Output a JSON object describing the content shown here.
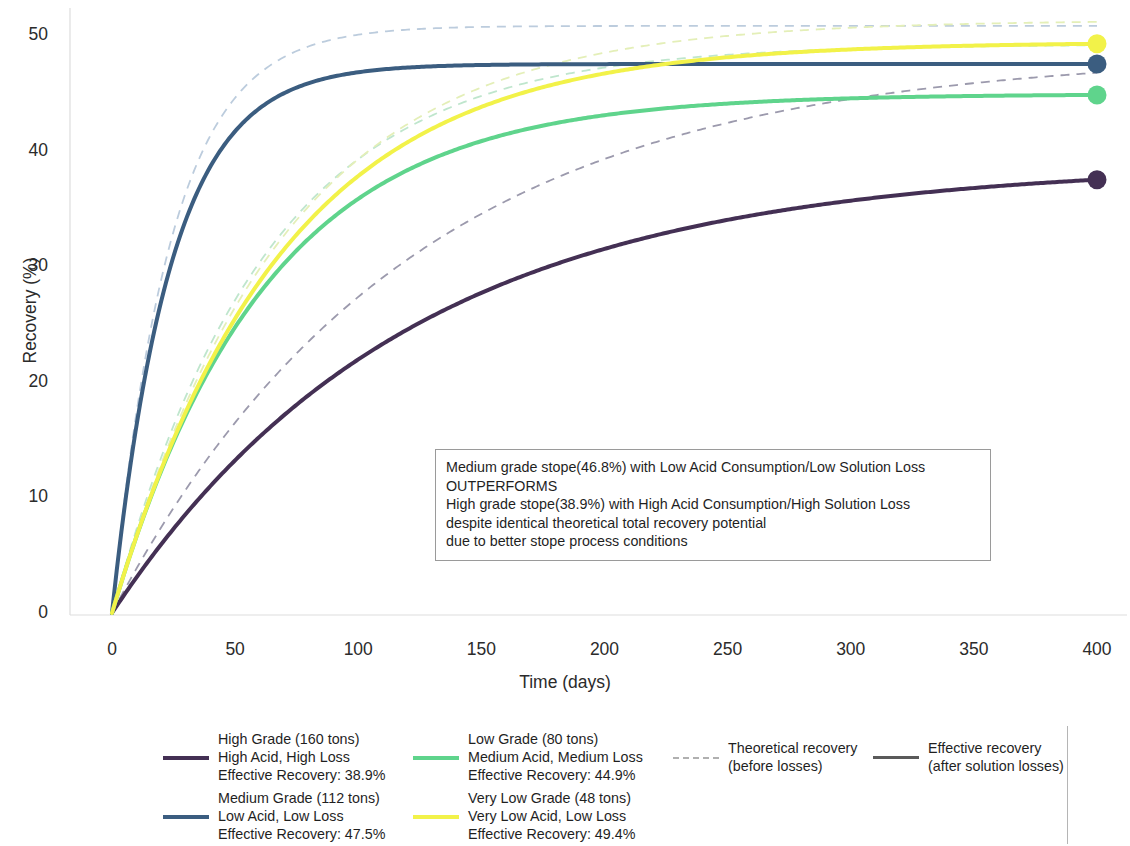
{
  "chart_data": {
    "type": "line",
    "title": "",
    "xlabel": "Time (days)",
    "ylabel": "Recovery (%)",
    "xlim": [
      0,
      400
    ],
    "ylim": [
      0,
      52
    ],
    "xticks": [
      0,
      50,
      100,
      150,
      200,
      250,
      300,
      350,
      400
    ],
    "yticks": [
      0,
      10,
      20,
      30,
      40,
      50
    ],
    "grid": false,
    "legend_position": "below-plot",
    "x": [
      0,
      10,
      20,
      30,
      40,
      50,
      60,
      70,
      80,
      90,
      100,
      120,
      140,
      160,
      180,
      200,
      220,
      240,
      260,
      280,
      300,
      320,
      340,
      360,
      380,
      400
    ],
    "series": [
      {
        "name": "High Grade (160 tons) — High Acid, High Loss",
        "style": "solid",
        "kind": "effective",
        "color": "#443054",
        "rmax": 38.9,
        "k": 0.0083,
        "endpoint_value": 38.9,
        "values": [
          0.0,
          3.1,
          5.96,
          8.6,
          11.03,
          13.27,
          15.34,
          17.24,
          19.0,
          20.62,
          22.11,
          24.74,
          26.97,
          28.85,
          30.44,
          31.79,
          32.92,
          33.89,
          34.7,
          35.39,
          35.97,
          36.46,
          36.88,
          37.23,
          37.53,
          37.78
        ]
      },
      {
        "name": "Medium Grade (112 tons) — Low Acid, Low Loss",
        "style": "solid",
        "kind": "effective",
        "color": "#3b5d80",
        "rmax": 47.5,
        "k": 0.042,
        "endpoint_value": 47.5,
        "values": [
          0.0,
          15.88,
          26.33,
          33.2,
          37.72,
          40.69,
          42.65,
          43.93,
          44.78,
          45.34,
          45.71,
          46.09,
          46.25,
          46.32,
          46.35,
          46.36,
          46.37,
          46.37,
          46.37,
          46.37,
          46.37,
          46.37,
          46.37,
          46.37,
          46.37,
          46.37
        ]
      },
      {
        "name": "Low Grade (80 tons) — Medium Acid, Medium Loss",
        "style": "solid",
        "kind": "effective",
        "color": "#5fd48c",
        "rmax": 44.9,
        "k": 0.016,
        "endpoint_value": 44.9,
        "values": [
          0.0,
          6.64,
          12.3,
          17.13,
          21.25,
          24.75,
          27.74,
          30.28,
          32.45,
          34.3,
          35.87,
          38.35,
          40.13,
          41.41,
          42.33,
          42.99,
          43.46,
          43.8,
          44.04,
          44.22,
          44.34,
          44.43,
          44.49,
          44.54,
          44.57,
          44.59
        ]
      },
      {
        "name": "Very Low Grade (48 tons) — Very Low Acid, Low Loss",
        "style": "solid",
        "kind": "effective",
        "color": "#f2f249",
        "rmax": 49.4,
        "k": 0.0145,
        "endpoint_value": 49.4,
        "values": [
          0.0,
          6.67,
          12.44,
          17.43,
          21.75,
          25.49,
          28.72,
          31.52,
          33.94,
          36.03,
          37.84,
          40.74,
          42.86,
          44.41,
          45.54,
          46.37,
          46.98,
          47.42,
          47.75,
          47.98,
          48.16,
          48.29,
          48.39,
          48.46,
          48.51,
          48.55
        ]
      },
      {
        "name": "High Grade theoretical",
        "style": "dashed",
        "kind": "theoretical",
        "color": "#9c9aad",
        "rmax": 48.5,
        "k": 0.0083,
        "values": [
          0.0,
          3.86,
          7.43,
          10.73,
          13.76,
          16.55,
          19.13,
          21.5,
          23.69,
          25.71,
          27.57,
          30.85,
          33.63,
          35.98,
          37.96,
          39.64,
          41.05,
          42.26,
          43.27,
          44.13,
          44.85,
          45.46,
          45.98,
          46.42,
          46.8,
          47.11
        ]
      },
      {
        "name": "Medium Grade theoretical",
        "style": "dashed",
        "kind": "theoretical",
        "color": "#bcccdd",
        "rmax": 50.8,
        "k": 0.042,
        "values": [
          0.0,
          16.98,
          28.16,
          35.51,
          40.34,
          43.52,
          45.61,
          46.98,
          47.89,
          48.49,
          48.88,
          49.29,
          49.46,
          49.53,
          49.56,
          49.58,
          49.58,
          49.59,
          49.59,
          49.59,
          49.59,
          49.59,
          49.59,
          49.59,
          49.59,
          49.59
        ]
      },
      {
        "name": "Low Grade theoretical",
        "style": "dashed",
        "kind": "theoretical",
        "color": "#bfe6cd",
        "rmax": 49.2,
        "k": 0.016,
        "values": [
          0.0,
          7.27,
          13.47,
          18.76,
          23.27,
          27.11,
          30.39,
          33.18,
          35.56,
          37.59,
          39.31,
          42.02,
          43.97,
          45.37,
          46.37,
          47.09,
          47.61,
          47.98,
          48.24,
          48.43,
          48.57,
          48.67,
          48.74,
          48.79,
          48.83,
          48.85
        ]
      },
      {
        "name": "Very Low Grade theoretical",
        "style": "dashed",
        "kind": "theoretical",
        "color": "#e4efb8",
        "rmax": 51.3,
        "k": 0.0145,
        "values": [
          0.0,
          6.93,
          12.92,
          18.1,
          22.59,
          26.47,
          29.82,
          32.73,
          35.24,
          37.42,
          39.3,
          42.31,
          44.52,
          46.13,
          47.3,
          48.16,
          48.79,
          49.25,
          49.59,
          49.83,
          50.01,
          50.14,
          50.24,
          50.31,
          50.37,
          50.41
        ]
      }
    ],
    "endpoint_markers": [
      {
        "label": "High Grade",
        "x": 400,
        "y": 38.9,
        "color": "#443054"
      },
      {
        "label": "Medium Grade",
        "x": 400,
        "y": 47.5,
        "color": "#3b5d80"
      },
      {
        "label": "Low Grade",
        "x": 400,
        "y": 44.9,
        "color": "#5fd48c"
      },
      {
        "label": "Very Low Grade",
        "x": 400,
        "y": 49.4,
        "color": "#f2f249"
      }
    ],
    "annotation": {
      "lines": [
        "Medium grade stope(46.8%) with Low Acid Consumption/Low Solution Loss",
        "OUTPERFORMS",
        "High grade stope(38.9%) with High Acid Consumption/High Solution Loss",
        "despite identical theoretical total recovery potential",
        "due to better stope process conditions"
      ]
    },
    "legend": {
      "entries": [
        {
          "color": "#443054",
          "style": "solid",
          "line1": "High Grade (160 tons)",
          "line2": "High Acid, High Loss",
          "line3": "Effective Recovery: 38.9%"
        },
        {
          "color": "#5fd48c",
          "style": "solid",
          "line1": "Low Grade (80 tons)",
          "line2": "Medium Acid, Medium Loss",
          "line3": "Effective Recovery: 44.9%"
        },
        {
          "color": "#3b5d80",
          "style": "solid",
          "line1": "Medium Grade (112 tons)",
          "line2": "Low Acid, Low Loss",
          "line3": "Effective Recovery: 47.5%"
        },
        {
          "color": "#f2f249",
          "style": "solid",
          "line1": "Very Low Grade (48 tons)",
          "line2": "Very Low Acid, Low Loss",
          "line3": "Effective Recovery: 49.4%"
        }
      ],
      "style_entries": [
        {
          "color": "#b0b0b0",
          "style": "dashed",
          "line1": "Theoretical recovery",
          "line2": "(before losses)"
        },
        {
          "color": "#5a5a5a",
          "style": "solid",
          "line1": "Effective recovery",
          "line2": "(after solution losses)"
        }
      ]
    }
  }
}
